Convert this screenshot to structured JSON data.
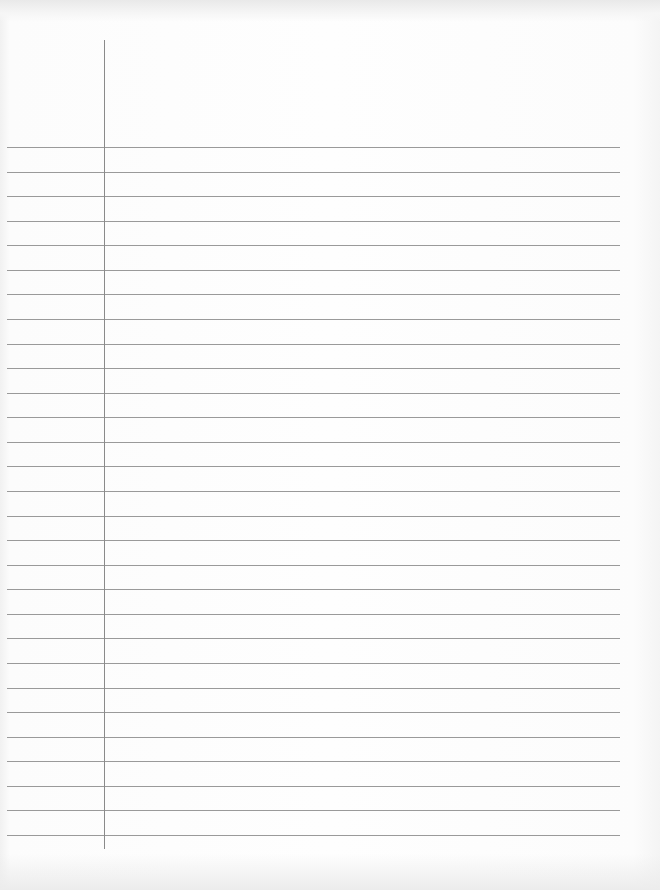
{
  "document": {
    "type": "ruled-notebook-page",
    "content": "",
    "rule_count": 29,
    "colors": {
      "paper": "#fbfbfb",
      "rule_line": "#9a9a9a",
      "margin_line": "#8a8a8a"
    }
  }
}
